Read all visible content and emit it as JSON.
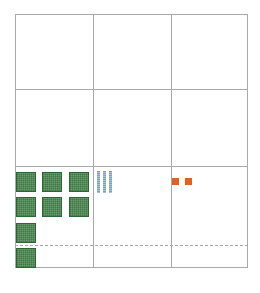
{
  "diagram": {
    "type": "place-value-chart",
    "columns": 3,
    "rows": 3,
    "colors": {
      "grid_line": "#a8a8a8",
      "hundreds_block": "#3d7a43",
      "tens_rod": "#7aa0c8",
      "ones_unit": "#e0602a"
    },
    "place_value_row": {
      "hundreds_flats": 8,
      "tens_rods": 3,
      "ones_units": 2
    },
    "represented_value": 832
  }
}
